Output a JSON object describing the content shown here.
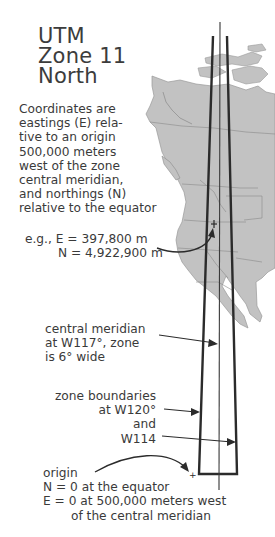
{
  "title": {
    "lines": [
      "UTM",
      "Zone 11",
      "North"
    ]
  },
  "description": {
    "lines": [
      "Coordinates are",
      "eastings (E) rela-",
      "tive to an origin",
      "500,000 meters",
      "west of the zone",
      "central meridian,",
      "and northings (N)",
      "relative to the equator"
    ]
  },
  "example": {
    "easting": "e.g., E = 397,800 m",
    "northing": "N = 4,922,900 m"
  },
  "central_meridian": {
    "line1": "central meridian",
    "line2": "at W117°, zone",
    "line3": "is 6° wide"
  },
  "zone_boundaries": {
    "line1": "zone boundaries",
    "line2": "at W120°",
    "line3": "and",
    "line4": "W114"
  },
  "origin": {
    "line1": "origin",
    "line2": "N = 0 at the equator",
    "line3": "E = 0 at 500,000 meters west",
    "line4": "of the central meridian"
  },
  "colors": {
    "land": "#c2c2c2",
    "land_border": "#8a8a8a",
    "zone_line": "#2b2b2b",
    "text": "#3a3a3a"
  }
}
